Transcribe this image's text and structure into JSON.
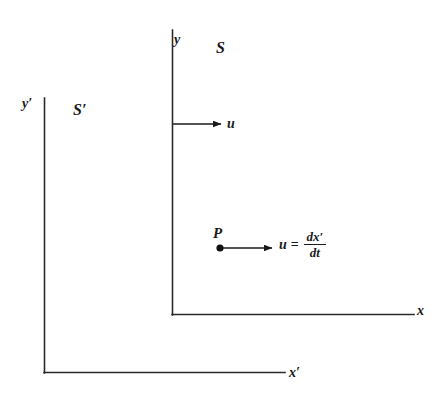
{
  "diagram": {
    "background_color": "#ffffff",
    "line_color": "#1a1a1a",
    "frames": [
      {
        "name": "S",
        "label": "S",
        "origin": [
          172,
          315
        ],
        "y_axis_label": "y",
        "x_axis_label": "x"
      },
      {
        "name": "S'",
        "label": "S′",
        "origin": [
          44,
          373
        ],
        "y_axis_label": "y′",
        "x_axis_label": "x′"
      }
    ],
    "labels": {
      "y": "y",
      "S": "S",
      "y_prime": "y′",
      "S_prime": "S′",
      "u_frame": "u",
      "P": "P",
      "x": "x",
      "x_prime": "x′"
    },
    "velocity_arrows": [
      {
        "id": "frame-velocity",
        "label": "u",
        "from": [
          173,
          124
        ],
        "to": [
          221,
          124
        ],
        "description": "velocity of frame S' relative to S"
      },
      {
        "id": "particle-velocity",
        "label": "u = dx'/dt",
        "from": [
          221,
          248
        ],
        "to": [
          272,
          248
        ],
        "description": "velocity of particle P"
      }
    ],
    "equation": {
      "lhs": "u",
      "operator": "=",
      "numerator": "dx′",
      "denominator": "dt"
    },
    "point": {
      "label": "P",
      "position": [
        220,
        248
      ]
    }
  }
}
